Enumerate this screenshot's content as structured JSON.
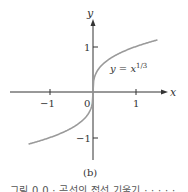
{
  "chart_data": {
    "type": "line",
    "title": "",
    "panel_label": "(b)",
    "xlabel": "x",
    "ylabel": "y",
    "x_ticks": [
      -1,
      0,
      1
    ],
    "y_ticks": [
      -1,
      1
    ],
    "xlim": [
      -1.95,
      1.65
    ],
    "ylim": [
      -1.6,
      1.65
    ],
    "grid": false,
    "series": [
      {
        "name": "y = x^(1/3)",
        "function": "cbrt(x)",
        "x_range": [
          -1.5,
          1.5
        ],
        "x": [
          -1.5,
          -1.0,
          -0.5,
          -0.125,
          0,
          0.125,
          0.5,
          1.0,
          1.5
        ],
        "y": [
          -1.145,
          -1.0,
          -0.794,
          -0.5,
          0,
          0.5,
          0.794,
          1.0,
          1.145
        ],
        "color": "#9a9a9a"
      }
    ],
    "annotations": [
      {
        "text": "y = x",
        "superscript": "1/3",
        "at": [
          0.45,
          0.55
        ]
      }
    ]
  },
  "labels": {
    "x_axis": "x",
    "y_axis": "y",
    "tick_x_neg1": "−1",
    "tick_x_0": "0",
    "tick_x_1": "1",
    "tick_y_1": "1",
    "tick_y_neg1": "−1",
    "curve_label_base": "y = x",
    "curve_label_exp": "1/3",
    "panel": "(b)"
  },
  "caption_partial": "그림 0.0 · 곡선의 접선 기울기 · · · · ·",
  "colors": {
    "axis": "#333333",
    "curve": "#9a9a9a",
    "text": "#333333"
  }
}
